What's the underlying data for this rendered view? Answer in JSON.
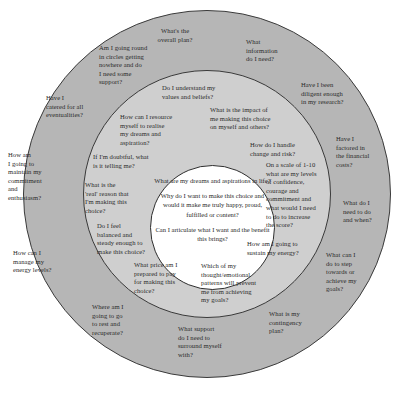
{
  "diagram": {
    "type": "concentric-circles",
    "title": "",
    "colors": {
      "outer_ring": "#b6b6b6",
      "middle_ring": "#cfcfcf",
      "inner_circle": "#ffffff",
      "stroke": "#3a3a3a",
      "text": "#2a2a2a",
      "background": "#ffffff"
    },
    "inner": {
      "questions": [
        "What are my dreams and aspirations in life?",
        "Why do I want to make this choice and would it make me truly happy, proud, fulfilled or content?",
        "Can I articulate what I want and the benefit this brings?"
      ]
    },
    "middle": {
      "questions": [
        "Do I understand my\nvalues and beliefs?",
        "What is the impact of\nme making this choice\non myself and others?",
        "How can I resource\nmyself to realise\nmy dreams and\naspiration?",
        "How do I handle\nchange and risk?",
        "If I'm doubtful, what\nis it telling me?",
        "On a scale of 1-10\nwhat are my levels\nof confidence,\ncourage and\ncommitment and\nwhat would I need\nto do to increase\nthe score?",
        "What is the\n'real' reason that\nI'm making this\nchoice?",
        "Do I feel\nbalanced and\nsteady enough to\nmake this choice?",
        "How am I going to\nsustain my energy?",
        "What price am I\nprepared to pay\nfor making this\nchoice?",
        "Which of my\nthought/emotional\npatterns will prevent\nme from achieving\nmy goals?",
        "What support\ndo I need to\nsurround myself\nwith?"
      ]
    },
    "outer": {
      "questions": [
        "What's the\noverall plan?",
        "What\ninformation\ndo I need?",
        "Am I going round\nin circles getting\nnowhere and do\nI need some\nsupport?",
        "Have I been\ndiligent enough\nin my research?",
        "Have I\ncatered for all\neventualities?",
        "Have I\nfactored in\nthe financial\ncosts?",
        "How am\nI going to\nmaintain my\ncommitment\nand\nenthusiasm?",
        "What do I\nneed to do\nand when?",
        "How can I\nmanage my\nenergy levels?",
        "What can I\ndo to step\ntowards or\nachieve my\ngoals?",
        "Where am I\ngoing to go\nto rest and\nrecuperate?",
        "What is my\ncontingency\nplan?"
      ]
    }
  }
}
